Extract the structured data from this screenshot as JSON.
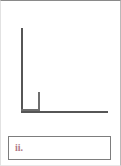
{
  "page": {
    "width": 121,
    "height": 166,
    "background_color": "#ffffff",
    "border_color": "#8a8a8a"
  },
  "figure": {
    "name": "right-angle-diagram",
    "stroke_color": "#565656",
    "marker_color": "#6e6e6e",
    "vertical_ray_label": "",
    "horizontal_ray_label": "",
    "right_angle_marker_label": ""
  },
  "answer_box": {
    "label": "ii.",
    "value": "",
    "placeholder": "",
    "text_color": "#b07a87",
    "border_color": "#7d7d7d",
    "background_color": "#ffffff"
  },
  "chart_data": {
    "type": "line",
    "title": "",
    "xlabel": "",
    "ylabel": "",
    "series": [
      {
        "name": "vertical-ray",
        "x": [
          21,
          21
        ],
        "y": [
          28,
          111
        ]
      },
      {
        "name": "horizontal-ray",
        "x": [
          21,
          108
        ],
        "y": [
          111,
          111
        ]
      },
      {
        "name": "right-angle-marker",
        "x": [
          40,
          40,
          21
        ],
        "y": [
          92,
          111,
          111
        ]
      }
    ],
    "grid": false,
    "legend": "none",
    "annotations": [
      {
        "text": "ii.",
        "x": 14,
        "y": 150
      }
    ]
  }
}
